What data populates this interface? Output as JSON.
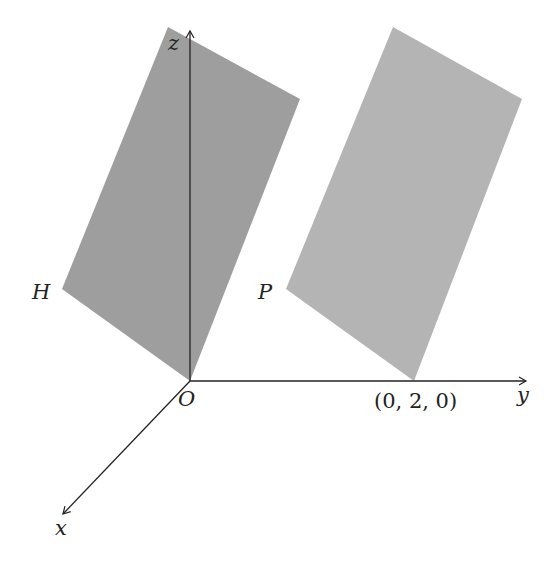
{
  "diagram": {
    "type": "3d-coordinate-planes",
    "axes": {
      "x": {
        "label": "x"
      },
      "y": {
        "label": "y"
      },
      "z": {
        "label": "z"
      }
    },
    "origin_label": "O",
    "point_label": "(0, 2, 0)",
    "planes": [
      {
        "name": "H",
        "label": "H",
        "color": "#9e9e9e",
        "passes_through": "O"
      },
      {
        "name": "P",
        "label": "P",
        "color": "#b4b4b4",
        "passes_through": "(0,2,0)"
      }
    ],
    "colors": {
      "axis": "#222222",
      "plane_h": "#9e9e9e",
      "plane_p": "#b4b4b4"
    }
  }
}
